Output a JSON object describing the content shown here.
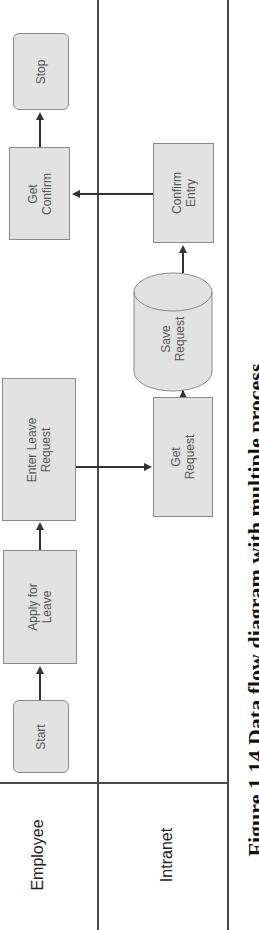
{
  "diagram": {
    "orientation": "rotated-90-ccw",
    "lanes": [
      {
        "id": "employee",
        "label": "Employee"
      },
      {
        "id": "intranet",
        "label": "Intranet"
      }
    ],
    "nodes": [
      {
        "id": "start",
        "label": "Start",
        "lane": "employee",
        "shape": "rounded-rect"
      },
      {
        "id": "apply",
        "label": "Apply for\nLeave",
        "lane": "employee",
        "shape": "rect"
      },
      {
        "id": "enter",
        "label": "Enter Leave\nRequest",
        "lane": "employee",
        "shape": "rect"
      },
      {
        "id": "get_request",
        "label": "Get\nRequest",
        "lane": "intranet",
        "shape": "rect"
      },
      {
        "id": "save_request",
        "label": "Save\nRequest",
        "lane": "intranet",
        "shape": "cylinder"
      },
      {
        "id": "confirm_entry",
        "label": "Confirm\nEntry",
        "lane": "intranet",
        "shape": "rect"
      },
      {
        "id": "get_confirm",
        "label": "Get\nConfirm",
        "lane": "employee",
        "shape": "rect"
      },
      {
        "id": "stop",
        "label": "Stop",
        "lane": "employee",
        "shape": "rounded-rect"
      }
    ],
    "edges": [
      {
        "from": "start",
        "to": "apply"
      },
      {
        "from": "apply",
        "to": "enter"
      },
      {
        "from": "enter",
        "to": "get_request"
      },
      {
        "from": "get_request",
        "to": "save_request"
      },
      {
        "from": "save_request",
        "to": "confirm_entry"
      },
      {
        "from": "confirm_entry",
        "to": "get_confirm"
      },
      {
        "from": "get_confirm",
        "to": "stop"
      }
    ],
    "caption": "Figure 1.14 Data flow diagram with multiple process"
  },
  "colors": {
    "node_fill": "#e2e2e2",
    "node_border": "#8a8a8a",
    "lines": "#4a4a4a"
  }
}
